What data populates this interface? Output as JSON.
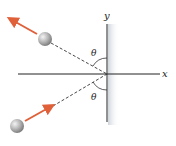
{
  "diagram": {
    "type": "physics-reflection",
    "axes": {
      "x_label": "x",
      "y_label": "y",
      "origin": [
        107,
        74
      ]
    },
    "angles": {
      "incident_label": "θ",
      "reflected_label": "θ"
    },
    "balls": [
      {
        "name": "outgoing-ball",
        "center": [
          45,
          39
        ],
        "radius": 7
      },
      {
        "name": "incoming-ball",
        "center": [
          17,
          126
        ],
        "radius": 7
      }
    ],
    "arrows": [
      {
        "name": "outgoing-velocity",
        "from": [
          37,
          34
        ],
        "to": [
          9,
          18
        ]
      },
      {
        "name": "incoming-velocity",
        "from": [
          25,
          121
        ],
        "to": [
          53,
          106
        ]
      }
    ],
    "colors": {
      "arrow": "#e0603a",
      "axis": "#222222",
      "dashed": "#333333",
      "wall_shade": "#d8dde3",
      "ball_light": "#f2f2f2",
      "ball_dark": "#7a7a7a"
    }
  }
}
